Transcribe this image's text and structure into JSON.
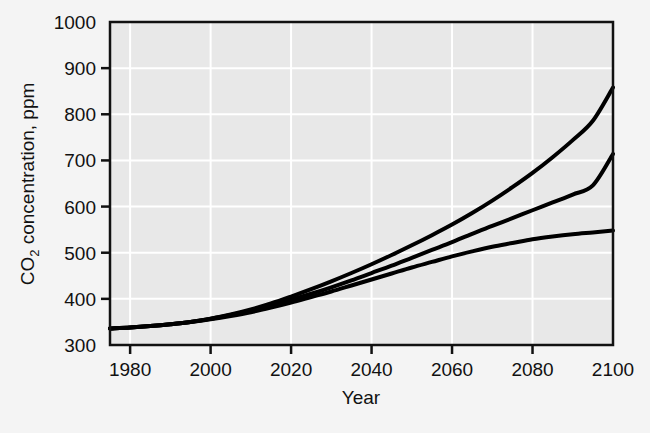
{
  "chart_data": {
    "type": "line",
    "title": "",
    "subtitle": "",
    "xlabel": "Year",
    "ylabel": "CO2 concentration, ppm",
    "ylabel_main": "CO",
    "ylabel_sub": "2",
    "ylabel_rest": " concentration, ppm",
    "xlim": [
      1975,
      2100
    ],
    "ylim": [
      300,
      1000
    ],
    "grid": true,
    "legend": "none",
    "xticks": [
      1980,
      2000,
      2020,
      2040,
      2060,
      2080,
      2100
    ],
    "xtick_labels": [
      "1980",
      "2000",
      "2020",
      "2040",
      "2060",
      "2080",
      "2100"
    ],
    "yticks": [
      300,
      400,
      500,
      600,
      700,
      800,
      900,
      1000
    ],
    "ytick_labels": [
      "300",
      "400",
      "500",
      "600",
      "700",
      "800",
      "900",
      "1000"
    ],
    "x": [
      1975,
      1980,
      1985,
      1990,
      1995,
      2000,
      2005,
      2010,
      2015,
      2020,
      2025,
      2030,
      2035,
      2040,
      2045,
      2050,
      2055,
      2060,
      2065,
      2070,
      2075,
      2080,
      2085,
      2090,
      2095,
      2100
    ],
    "series": [
      {
        "name": "high-scenario",
        "color": "#000000",
        "values": [
          336,
          338,
          341,
          345,
          350,
          357,
          366,
          377,
          390,
          405,
          421,
          438,
          456,
          475,
          495,
          516,
          538,
          561,
          586,
          613,
          642,
          673,
          707,
          744,
          786,
          858
        ]
      },
      {
        "name": "mid-scenario",
        "color": "#000000",
        "values": [
          336,
          338,
          341,
          345,
          350,
          357,
          365,
          375,
          386,
          398,
          411,
          425,
          440,
          456,
          472,
          489,
          506,
          523,
          541,
          558,
          575,
          592,
          609,
          626,
          646,
          714
        ]
      },
      {
        "name": "low-scenario",
        "color": "#000000",
        "values": [
          336,
          338,
          341,
          345,
          350,
          356,
          363,
          371,
          381,
          392,
          404,
          416,
          429,
          442,
          455,
          468,
          480,
          492,
          503,
          513,
          521,
          529,
          535,
          540,
          544,
          548
        ]
      }
    ],
    "colors": {
      "plot_background": "#e8e8e8",
      "page_background": "#f4f4f4",
      "gridline": "#ffffff",
      "axis": "#111111",
      "curve": "#000000"
    }
  }
}
